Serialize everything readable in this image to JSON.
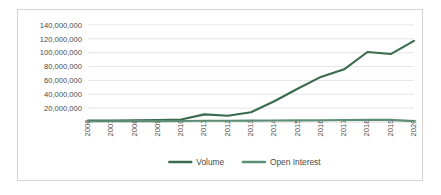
{
  "chart_data": {
    "type": "line",
    "title": "",
    "xlabel": "",
    "ylabel": "",
    "x": [
      2006,
      2007,
      2008,
      2009,
      2010,
      2011,
      2012,
      2013,
      2014,
      2015,
      2016,
      2017,
      2018,
      2019,
      2020
    ],
    "categories": [
      "2006",
      "2007",
      "2008",
      "2009",
      "2010",
      "2011",
      "2012",
      "2013",
      "2014",
      "2015",
      "2016",
      "2017",
      "2018",
      "2019",
      "2020"
    ],
    "series": [
      {
        "name": "Volume",
        "color": "#3a6b4e",
        "values": [
          2000000,
          2200000,
          2500000,
          2800000,
          3500000,
          11000000,
          9000000,
          14000000,
          30000000,
          48000000,
          65000000,
          76000000,
          101000000,
          98000000,
          117000000
        ]
      },
      {
        "name": "Open Interest",
        "color": "#5e8f74",
        "values": [
          1000000,
          1100000,
          1200000,
          1300000,
          1500000,
          1800000,
          1900000,
          2000000,
          2200000,
          2400000,
          2600000,
          2800000,
          3000000,
          3100000,
          1200000
        ]
      }
    ],
    "ylim": [
      0,
      150000000
    ],
    "yticks": [
      20000000,
      40000000,
      60000000,
      80000000,
      100000000,
      120000000,
      140000000
    ],
    "ytick_labels": [
      "20,000,000",
      "40,000,000",
      "60,000,000",
      "80,000,000",
      "100,000,000",
      "120,000,000",
      "140,000,000"
    ],
    "grid": true,
    "legend_position": "bottom",
    "legend": [
      "Volume",
      "Open Interest"
    ]
  },
  "legend": {
    "items": [
      {
        "label": "Volume",
        "color": "#3a6b4e"
      },
      {
        "label": "Open Interest",
        "color": "#5e8f74"
      }
    ]
  },
  "colors": {
    "volume": "#3a6b4e",
    "open_interest": "#5e8f74",
    "gridline": "#d9d9d9",
    "border": "#d4d4d4",
    "text": "#4a4a48",
    "background": "#ffffff"
  }
}
